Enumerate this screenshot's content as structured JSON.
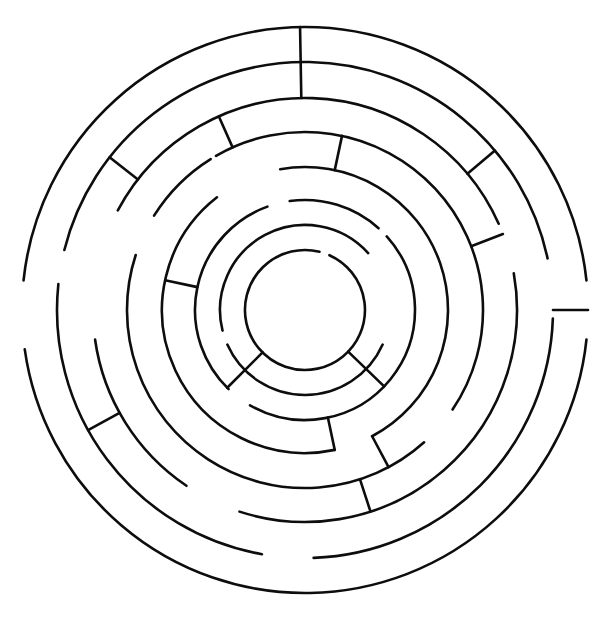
{
  "page": {
    "type": "maze-puzzle",
    "shape": "circular",
    "width": 604,
    "height": 620,
    "background_color": "#ffffff",
    "line_color": "#0d0d0d",
    "line_width": 2.6
  },
  "maze": {
    "center_x": 305,
    "center_y": 310,
    "ring_count": 8,
    "ring_radii": [
      60,
      85,
      110,
      143,
      178,
      212,
      248,
      283
    ],
    "entrance": {
      "label": "outer entrance",
      "location": "right",
      "angle_deg": 0
    },
    "goal": {
      "label": "center chamber",
      "radius": 60
    },
    "rings": [
      {
        "index": 0,
        "name": "center-chamber-wall",
        "radius": 60,
        "arcs": [
          {
            "start_deg": -66,
            "end_deg": 284
          }
        ]
      },
      {
        "index": 1,
        "name": "ring-1",
        "radius": 85,
        "arcs": [
          {
            "start_deg": 24,
            "end_deg": 156
          },
          {
            "start_deg": 166,
            "end_deg": 318
          }
        ]
      },
      {
        "index": 2,
        "name": "ring-2",
        "radius": 110,
        "arcs": [
          {
            "start_deg": -42,
            "end_deg": 120
          },
          {
            "start_deg": 134,
            "end_deg": 250
          },
          {
            "start_deg": 262,
            "end_deg": 312
          }
        ]
      },
      {
        "index": 3,
        "name": "ring-3",
        "radius": 143,
        "arcs": [
          {
            "start_deg": -100,
            "end_deg": 62
          },
          {
            "start_deg": 78,
            "end_deg": 232
          }
        ]
      },
      {
        "index": 4,
        "name": "ring-4",
        "radius": 178,
        "arcs": [
          {
            "start_deg": -120,
            "end_deg": 34
          },
          {
            "start_deg": 48,
            "end_deg": 198
          },
          {
            "start_deg": 212,
            "end_deg": 238
          }
        ]
      },
      {
        "index": 5,
        "name": "ring-5",
        "radius": 212,
        "arcs": [
          {
            "start_deg": -152,
            "end_deg": -24
          },
          {
            "start_deg": -10,
            "end_deg": 108
          },
          {
            "start_deg": 124,
            "end_deg": 172
          }
        ]
      },
      {
        "index": 6,
        "name": "ring-6",
        "radius": 248,
        "arcs": [
          {
            "start_deg": -166,
            "end_deg": -12
          },
          {
            "start_deg": 2,
            "end_deg": 88
          },
          {
            "start_deg": 100,
            "end_deg": 186
          }
        ]
      },
      {
        "index": 7,
        "name": "outer-boundary",
        "radius": 283,
        "arcs": [
          {
            "start_deg": -174,
            "end_deg": -6
          },
          {
            "start_deg": 6,
            "end_deg": 172
          }
        ]
      }
    ],
    "radial_walls": [
      {
        "name": "radial-top-entrance",
        "angle_deg": 269,
        "r_inner": 212,
        "r_outer": 283
      },
      {
        "name": "radial-right-entrance",
        "angle_deg": 0,
        "r_inner": 248,
        "r_outer": 283
      },
      {
        "name": "radial-upper-right-outer",
        "angle_deg": 320,
        "r_inner": 212,
        "r_outer": 248
      },
      {
        "name": "radial-upper-left-outer",
        "angle_deg": 218,
        "r_inner": 212,
        "r_outer": 248
      },
      {
        "name": "radial-right-mid",
        "angle_deg": 339,
        "r_inner": 178,
        "r_outer": 212
      },
      {
        "name": "radial-lower-left-mid",
        "angle_deg": 151,
        "r_inner": 212,
        "r_outer": 248
      },
      {
        "name": "radial-upper-left-inner",
        "angle_deg": 246,
        "r_inner": 178,
        "r_outer": 212
      },
      {
        "name": "radial-top-inner",
        "angle_deg": 282,
        "r_inner": 143,
        "r_outer": 178
      },
      {
        "name": "radial-bottom-mid",
        "angle_deg": 72,
        "r_inner": 178,
        "r_outer": 212
      },
      {
        "name": "radial-bottom-inner",
        "angle_deg": 62,
        "r_inner": 143,
        "r_outer": 178
      },
      {
        "name": "radial-left-inner",
        "angle_deg": 192,
        "r_inner": 110,
        "r_outer": 143
      },
      {
        "name": "radial-lower-left-core",
        "angle_deg": 135,
        "r_inner": 60,
        "r_outer": 110
      },
      {
        "name": "radial-lower-right-core",
        "angle_deg": 44,
        "r_inner": 60,
        "r_outer": 110
      },
      {
        "name": "radial-bottom-core",
        "angle_deg": 78,
        "r_inner": 110,
        "r_outer": 143
      }
    ]
  }
}
